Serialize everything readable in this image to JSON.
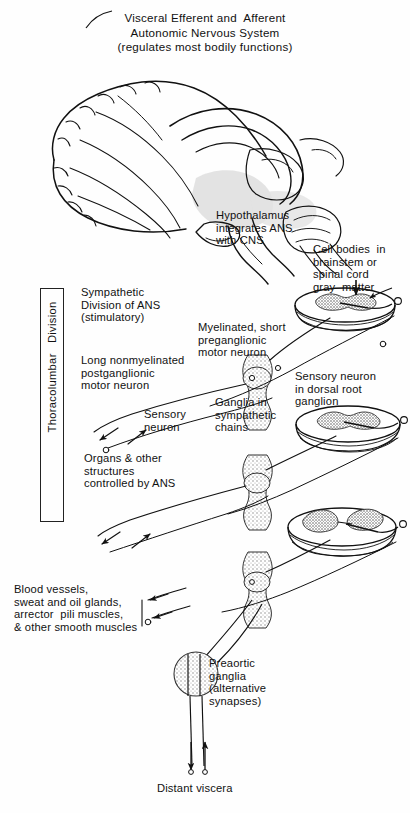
{
  "figure": {
    "title_lines": [
      "Visceral Efferent and  Afferent",
      "Autonomic Nervous System",
      "(regulates most bodily functions)"
    ],
    "bracket_label": "Thoracolumbar   Division"
  },
  "labels": {
    "hypothalamus": "Hypothalamus\nintegrates ANS\nwith CNS",
    "cell_bodies": "Cell bodies  in\nbrainstem or\nspinal cord\ngray  matter",
    "sympathetic_division": "Sympathetic\nDivision of ANS\n(stimulatory)",
    "postganglionic": "Long nonmyelinated\npostganglionic\nmotor neuron",
    "preganglionic": "Myelinated, short\npreganglionic\nmotor neuron",
    "sensory_neuron_left": "Sensory\nneuron",
    "sensory_dorsal_root": "Sensory neuron\nin dorsal root\nganglion",
    "ganglia_chains": "Ganglia in\nsympathetic\nchains",
    "organs": "Organs & other\nstructures\ncontrolled by ANS",
    "effectors": "Blood vessels,\nsweat and oil glands,\narrector  pili muscles,\n& other smooth muscles",
    "preaortic": "Preaortic\nganglia\n(alternative\nsynapses)",
    "distant_viscera": "Distant viscera"
  },
  "colors": {
    "ink": "#111111",
    "stipple": "#9a9a9a",
    "shade": "#d9d9d9",
    "paper": "#fefefe"
  }
}
